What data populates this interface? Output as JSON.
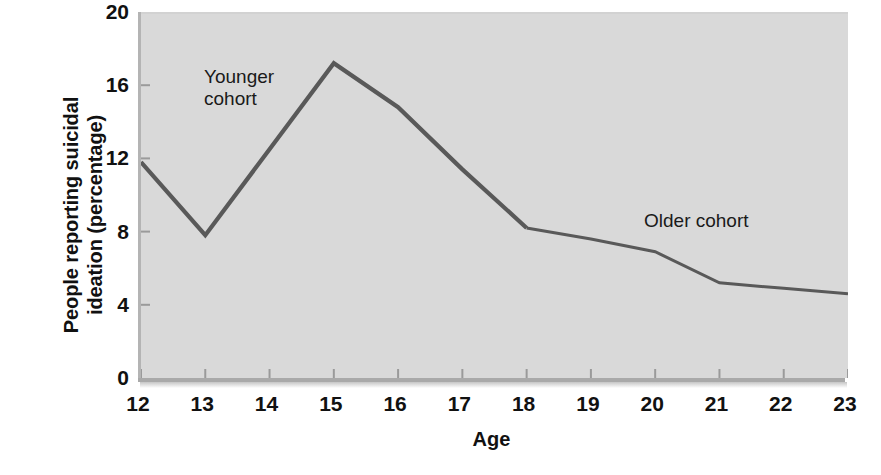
{
  "chart_data": {
    "type": "line",
    "title": "",
    "xlabel": "Age",
    "ylabel": "People reporting suicidal ideation (percentage)",
    "ylabel_line1": "People reporting suicidal",
    "ylabel_line2": "ideation (percentage)",
    "x": [
      12,
      13,
      14,
      15,
      16,
      17,
      18,
      19,
      20,
      21,
      22,
      23
    ],
    "xtick_labels": [
      "12",
      "13",
      "14",
      "15",
      "16",
      "17",
      "18",
      "19",
      "20",
      "21",
      "22",
      "23"
    ],
    "ytick_labels": [
      "0",
      "4",
      "8",
      "12",
      "16",
      "20"
    ],
    "yticks": [
      0,
      4,
      8,
      12,
      16,
      20
    ],
    "xlim": [
      12,
      23
    ],
    "ylim": [
      0,
      20
    ],
    "grid": false,
    "legend_position": "inline-annotations",
    "plot_background": "#d9d9d9",
    "line_color": "#595959",
    "series": [
      {
        "name": "Younger cohort",
        "x": [
          12,
          13,
          14,
          15,
          16,
          17,
          18
        ],
        "values": [
          11.8,
          7.8,
          12.5,
          17.2,
          14.8,
          11.4,
          8.2
        ]
      },
      {
        "name": "Older cohort",
        "x": [
          18,
          19,
          20,
          21,
          22,
          23
        ],
        "values": [
          8.2,
          7.6,
          6.9,
          5.2,
          4.9,
          4.6
        ]
      }
    ],
    "annotations": [
      {
        "text": "Younger cohort",
        "line1": "Younger",
        "line2": "cohort"
      },
      {
        "text": "Older cohort",
        "line1": "Older cohort",
        "line2": ""
      }
    ]
  }
}
